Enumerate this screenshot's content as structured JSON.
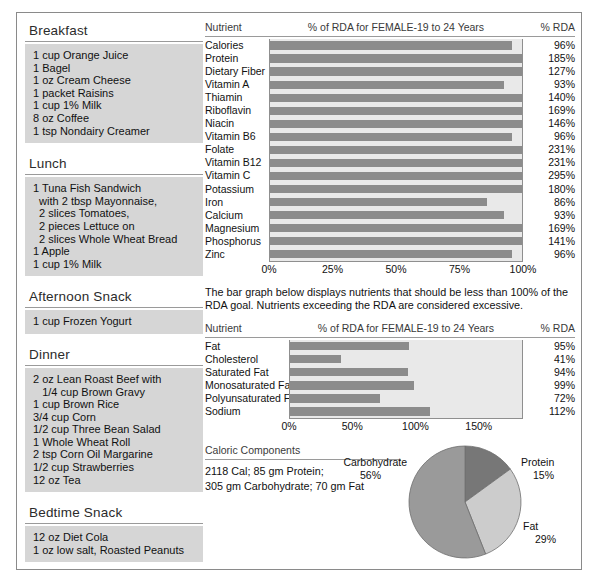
{
  "meals": [
    {
      "name": "Breakfast",
      "items": [
        "1 cup Orange Juice",
        "1 Bagel",
        "1 oz Cream Cheese",
        "1 packet Raisins",
        "1 cup 1% Milk",
        "8 oz Coffee",
        "1 tsp Nondairy Creamer"
      ]
    },
    {
      "name": "Lunch",
      "items": [
        "1 Tuna Fish Sandwich",
        "  with 2 tbsp Mayonnaise,",
        "  2 slices Tomatoes,",
        "  2 pieces Lettuce on",
        "  2 slices Whole Wheat Bread",
        "1 Apple",
        "1 cup 1% Milk"
      ]
    },
    {
      "name": "Afternoon Snack",
      "items": [
        "1 cup Frozen Yogurt"
      ]
    },
    {
      "name": "Dinner",
      "items": [
        "2 oz Lean Roast Beef with",
        "   1/4 cup Brown Gravy",
        "1 cup Brown Rice",
        "3/4 cup Corn",
        "1/2 cup Three Bean Salad",
        "1 Whole Wheat Roll",
        "2 tsp Corn Oil Margarine",
        "1/2 cup Strawberries",
        "12 oz Tea"
      ]
    },
    {
      "name": "Bedtime Snack",
      "items": [
        "12 oz Diet Cola",
        "1 oz low salt, Roasted Peanuts"
      ]
    }
  ],
  "note": "The bar graph below displays nutrients that should be less than 100% of the RDA goal.  Nutrients exceeding the RDA are considered excessive.",
  "caloric": {
    "heading": "Caloric Components",
    "line1": "2118 Cal; 85 gm Protein;",
    "line2": "305 gm Carbohydrate; 70 gm Fat"
  },
  "chart_data": [
    {
      "type": "bar",
      "orientation": "horizontal",
      "name": "rda-chart",
      "col_nutrient": "Nutrient",
      "title": "% of RDA for FEMALE-19 to 24 Years",
      "col_rda": "% RDA",
      "categories": [
        "Calories",
        "Protein",
        "Dietary Fiber",
        "Vitamin A",
        "Thiamin",
        "Riboflavin",
        "Niacin",
        "Vitamin B6",
        "Folate",
        "Vitamin B12",
        "Vitamin C",
        "Potassium",
        "Iron",
        "Calcium",
        "Magnesium",
        "Phosphorus",
        "Zinc"
      ],
      "values": [
        96,
        185,
        127,
        93,
        140,
        169,
        146,
        96,
        231,
        231,
        295,
        180,
        86,
        93,
        169,
        141,
        96
      ],
      "labels": [
        "96%",
        "185%",
        "127%",
        "93%",
        "140%",
        "169%",
        "146%",
        "96%",
        "231%",
        "231%",
        "295%",
        "180%",
        "86%",
        "93%",
        "169%",
        "141%",
        "96%"
      ],
      "xlim": [
        0,
        100
      ],
      "clipped_at": 100,
      "ticks": [
        0,
        25,
        50,
        75,
        100
      ],
      "tick_labels": [
        "0%",
        "25%",
        "50%",
        "75%",
        "100%"
      ],
      "xlabel": "",
      "ylabel": "",
      "grid": false,
      "legend": "none"
    },
    {
      "type": "bar",
      "orientation": "horizontal",
      "name": "limit-chart",
      "col_nutrient": "Nutrient",
      "title": "% of RDA for FEMALE-19 to 24 Years",
      "col_rda": "% RDA",
      "categories": [
        "Fat",
        "Cholesterol",
        "Saturated Fat",
        "Monosaturated Fat",
        "Polyunsaturated Fat",
        "Sodium"
      ],
      "values": [
        95,
        41,
        94,
        99,
        72,
        112
      ],
      "labels": [
        "95%",
        "41%",
        "94%",
        "99%",
        "72%",
        "112%"
      ],
      "xlim": [
        0,
        185
      ],
      "ticks": [
        0,
        50,
        100,
        150
      ],
      "tick_labels": [
        "0%",
        "50%",
        "100%",
        "150%"
      ],
      "xlabel": "",
      "ylabel": "",
      "grid": false,
      "legend": "none"
    },
    {
      "type": "pie",
      "name": "caloric-components-pie",
      "categories": [
        "Carbohydrate",
        "Protein",
        "Fat"
      ],
      "values": [
        56,
        15,
        29
      ],
      "labels": [
        "56%",
        "15%",
        "29%"
      ],
      "colors": [
        "#9a9a9a",
        "#777777",
        "#cccccc"
      ],
      "legend": "outside-labels"
    }
  ],
  "colors": {
    "bar": "#8c8c8c",
    "plot_bg": "#e9e9e9",
    "meal_bg": "#d6d6d6",
    "border": "#8a8a8a"
  }
}
